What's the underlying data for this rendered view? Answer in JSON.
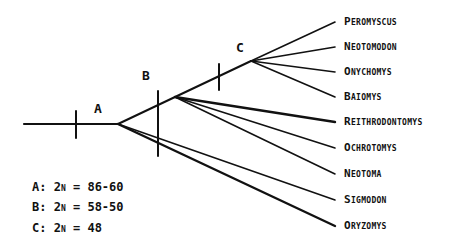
{
  "diagram": {
    "type": "phylogenetic-tree",
    "nodes": {
      "A": {
        "label": "A",
        "x": 118,
        "y": 124,
        "bar": {
          "x": 76,
          "y1": 111,
          "y2": 138
        },
        "label_pos": {
          "x": 98,
          "y": 108
        }
      },
      "B": {
        "label": "B",
        "x": 175,
        "y": 97,
        "bar": {
          "x": 158,
          "y1": 91,
          "y2": 156
        },
        "label_pos": {
          "x": 146,
          "y": 75
        }
      },
      "C": {
        "label": "C",
        "x": 251,
        "y": 61,
        "bar": {
          "x": 219,
          "y1": 64,
          "y2": 90
        },
        "label_pos": {
          "x": 240,
          "y": 47
        }
      }
    },
    "root": {
      "x1": 24,
      "y": 124
    },
    "taxa": [
      {
        "name": "Peromyscus",
        "from": "C",
        "x": 335,
        "y": 22,
        "thick": false
      },
      {
        "name": "Neotomodon",
        "from": "C",
        "x": 335,
        "y": 47,
        "thick": false
      },
      {
        "name": "Onychomys",
        "from": "C",
        "x": 335,
        "y": 72,
        "thick": false
      },
      {
        "name": "Baiomys",
        "from": "C",
        "x": 335,
        "y": 97,
        "thick": false
      },
      {
        "name": "Reithrodontomys",
        "from": "B",
        "x": 335,
        "y": 122,
        "thick": true
      },
      {
        "name": "Ochrotomys",
        "from": "B",
        "x": 335,
        "y": 148,
        "thick": false
      },
      {
        "name": "Neotoma",
        "from": "B",
        "x": 335,
        "y": 174,
        "thick": false
      },
      {
        "name": "Sigmodon",
        "from": "A",
        "x": 335,
        "y": 200,
        "thick": false
      },
      {
        "name": "Oryzomys",
        "from": "A",
        "x": 335,
        "y": 226,
        "thick": true
      }
    ],
    "legend": [
      {
        "node": "A",
        "prefix": "A: 2",
        "n": "n",
        "suffix": " = 86-60",
        "y": 187
      },
      {
        "node": "B",
        "prefix": "B: 2",
        "n": "n",
        "suffix": " = 58-50",
        "y": 207
      },
      {
        "node": "C",
        "prefix": "C: 2",
        "n": "n",
        "suffix": " = 48",
        "y": 228
      }
    ],
    "colors": {
      "line": "#111111",
      "background": "#ffffff"
    }
  }
}
